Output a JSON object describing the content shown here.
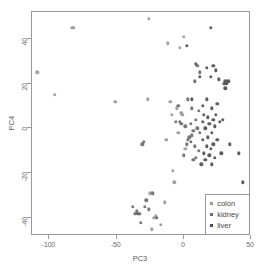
{
  "chart_data": {
    "type": "scatter",
    "title": "",
    "xlabel": "PC3",
    "ylabel": "PC4",
    "xlim": [
      -113,
      50
    ],
    "ylim": [
      -48,
      52
    ],
    "xticks": [
      -100,
      -50,
      0,
      50
    ],
    "yticks": [
      40,
      20,
      0,
      -20,
      -40
    ],
    "xticklabels": [
      "-100",
      "-50",
      "0",
      "50"
    ],
    "yticklabels": [
      "40",
      "20",
      "0",
      "-20",
      "-40"
    ],
    "grid": false,
    "legend_position": "lower right",
    "legend_entries": [
      {
        "label": "colon",
        "color": "#9a9a9a"
      },
      {
        "label": "kidney",
        "color": "#6b6b6b"
      },
      {
        "label": "liver",
        "color": "#4f4f4f"
      }
    ],
    "series": [
      {
        "name": "colon",
        "color": "#9a9a9a",
        "points": [
          [
            -109,
            25
          ],
          [
            -96,
            15
          ],
          [
            -83,
            45
          ],
          [
            -82,
            45
          ],
          [
            -51,
            12
          ],
          [
            -26,
            49
          ],
          [
            -27,
            13
          ],
          [
            -25,
            -29
          ],
          [
            -24,
            -45
          ],
          [
            -22,
            -40
          ],
          [
            -21,
            -39
          ],
          [
            -17,
            -43
          ],
          [
            -14,
            -33
          ],
          [
            -13,
            -5
          ],
          [
            -12,
            38
          ],
          [
            -10,
            12
          ],
          [
            -9,
            6
          ],
          [
            -8,
            -19
          ],
          [
            -7,
            -24
          ],
          [
            -5,
            9
          ],
          [
            -4,
            -2
          ],
          [
            -3,
            36
          ],
          [
            -2,
            7
          ],
          [
            -1,
            6
          ],
          [
            0,
            41
          ],
          [
            1,
            -9
          ]
        ]
      },
      {
        "name": "kidney",
        "color": "#6b6b6b",
        "points": [
          [
            -38,
            -35
          ],
          [
            -36,
            -38
          ],
          [
            -35,
            -37
          ],
          [
            -34,
            -38
          ],
          [
            -33,
            -38
          ],
          [
            -32,
            -42
          ],
          [
            -31,
            -7
          ],
          [
            -30,
            -6
          ],
          [
            -29,
            -35
          ],
          [
            -28,
            -32
          ],
          [
            -26,
            -36
          ],
          [
            -23,
            -29
          ],
          [
            -20,
            -40
          ],
          [
            -6,
            3
          ],
          [
            -4,
            10
          ],
          [
            -3,
            3
          ],
          [
            -2,
            2
          ],
          [
            0,
            -12
          ],
          [
            1,
            1
          ],
          [
            2,
            -7
          ],
          [
            3,
            -5
          ],
          [
            3,
            13
          ],
          [
            4,
            -4
          ],
          [
            5,
            -6
          ],
          [
            5,
            2
          ],
          [
            6,
            -3
          ],
          [
            6,
            9
          ],
          [
            7,
            -1
          ],
          [
            7,
            -14
          ],
          [
            8,
            21
          ],
          [
            8,
            -8
          ],
          [
            9,
            4
          ],
          [
            9,
            -13
          ],
          [
            10,
            0
          ],
          [
            10,
            28
          ],
          [
            11,
            -10
          ],
          [
            11,
            8
          ],
          [
            12,
            25
          ],
          [
            12,
            -2
          ]
        ]
      },
      {
        "name": "liver",
        "color": "#4f4f4f",
        "points": [
          [
            2,
            37
          ],
          [
            6,
            13
          ],
          [
            9,
            29
          ],
          [
            12,
            23
          ],
          [
            13,
            -16
          ],
          [
            14,
            10
          ],
          [
            14,
            -5
          ],
          [
            14,
            3
          ],
          [
            15,
            -11
          ],
          [
            15,
            6
          ],
          [
            16,
            0
          ],
          [
            16,
            -14
          ],
          [
            17,
            13
          ],
          [
            17,
            27
          ],
          [
            17,
            -8
          ],
          [
            18,
            5
          ],
          [
            18,
            -4
          ],
          [
            19,
            -12
          ],
          [
            19,
            2
          ],
          [
            20,
            45
          ],
          [
            20,
            23
          ],
          [
            20,
            -9
          ],
          [
            21,
            9
          ],
          [
            21,
            -2
          ],
          [
            21,
            -16
          ],
          [
            22,
            28
          ],
          [
            22,
            4
          ],
          [
            22,
            -7
          ],
          [
            23,
            1
          ],
          [
            23,
            -13
          ],
          [
            24,
            26
          ],
          [
            24,
            6
          ],
          [
            25,
            -5
          ],
          [
            25,
            11
          ],
          [
            26,
            22
          ],
          [
            27,
            3
          ],
          [
            28,
            -11
          ],
          [
            29,
            4
          ],
          [
            30,
            20
          ],
          [
            31,
            21
          ],
          [
            31,
            18
          ],
          [
            32,
            20
          ],
          [
            33,
            21
          ],
          [
            34,
            -7
          ],
          [
            41,
            -11
          ],
          [
            44,
            -24
          ],
          [
            46,
            -30
          ]
        ]
      }
    ]
  }
}
